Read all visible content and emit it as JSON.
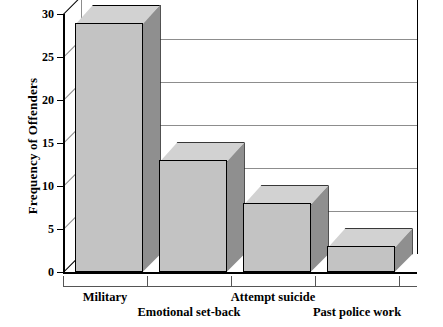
{
  "chart_data": {
    "type": "bar",
    "title": "",
    "xlabel": "",
    "ylabel": "Frequency of Offenders",
    "categories": [
      "Military",
      "Emotional set-back",
      "Attempt suicide",
      "Past police work"
    ],
    "values": [
      29,
      13,
      8,
      3
    ],
    "ylim": [
      0,
      30
    ],
    "yticks": [
      0,
      5,
      10,
      15,
      20,
      25,
      30
    ],
    "ytick_labels": [
      "0",
      "5",
      "10",
      "15",
      "20",
      "25",
      "30"
    ],
    "grid": "horizontal",
    "legend": "none",
    "style": "3d-column",
    "colors": {
      "bar_face": "#c3c3c3",
      "bar_side": "#8f8f8f",
      "bar_top": "#d2d2d2",
      "outline": "#000000",
      "gridline": "#8d8d8d",
      "background": "#ffffff"
    }
  }
}
